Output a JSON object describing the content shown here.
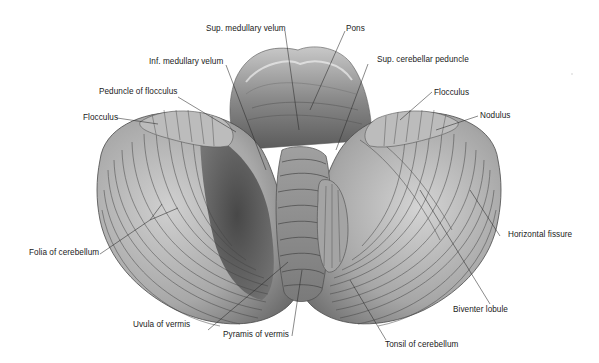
{
  "figure": {
    "colors": {
      "background": "#ffffff",
      "tissue_light": "#d8d8d8",
      "tissue_mid": "#9a9a9a",
      "tissue_dark": "#4a4a4a",
      "fissure_line": "#3a3a3a",
      "leader_line": "#2a2a2a",
      "label_text": "#1a1a1a"
    },
    "labels": {
      "sup_medullary_velum": "Sup. medullary velum",
      "pons": "Pons",
      "inf_medullary_velum": "Inf. medullary velum",
      "sup_cerebellar_peduncle": "Sup. cerebellar peduncle",
      "peduncle_of_flocculus": "Peduncle of flocculus",
      "flocculus_left": "Flocculus",
      "flocculus_right": "Flocculus",
      "nodulus": "Nodulus",
      "folia_of_cerebellum": "Folia of cerebellum",
      "horizontal_fissure": "Horizontal fissure",
      "biventer_lobule": "Biventer lobule",
      "uvula_of_vermis": "Uvula of vermis",
      "pyramis_of_vermis": "Pyramis of vermis",
      "tonsil_of_cerebellum": "Tonsil of cerebellum"
    }
  }
}
